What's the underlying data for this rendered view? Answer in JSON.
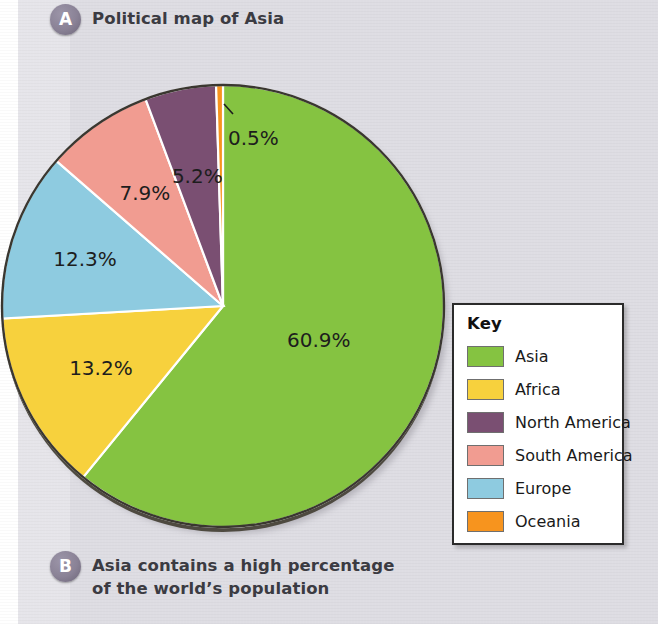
{
  "figure": {
    "caption_a": {
      "badge": "A",
      "text": "Political map of Asia"
    },
    "caption_b": {
      "badge": "B",
      "text_line1": "Asia contains a high percentage",
      "text_line2": "of the world’s population"
    }
  },
  "legend": {
    "title": "Key",
    "items": [
      {
        "label": "Asia",
        "color": "#85c341"
      },
      {
        "label": "Africa",
        "color": "#f7d13d"
      },
      {
        "label": "North America",
        "color": "#7a4f72"
      },
      {
        "label": "South America",
        "color": "#f19c91"
      },
      {
        "label": "Europe",
        "color": "#8ecbe0"
      },
      {
        "label": "Oceania",
        "color": "#f7941e"
      }
    ]
  },
  "chart_data": {
    "type": "pie",
    "title": "Political map of Asia",
    "xlabel": "",
    "ylabel": "",
    "legend_position": "right",
    "grid": false,
    "start_angle_deg": 0,
    "direction": "clockwise",
    "categories": [
      "Asia",
      "Africa",
      "Europe",
      "South America",
      "North America",
      "Oceania"
    ],
    "values": [
      60.9,
      13.2,
      12.3,
      7.9,
      5.2,
      0.5
    ],
    "labels": [
      "60.9%",
      "13.2%",
      "12.3%",
      "7.9%",
      "5.2%",
      "0.5%"
    ],
    "colors": [
      "#85c341",
      "#f7d13d",
      "#8ecbe0",
      "#f19c91",
      "#7a4f72",
      "#f7941e"
    ],
    "units": "percent of world population",
    "annotations": [
      "0.5% slice (Oceania) labelled with leader line"
    ]
  }
}
